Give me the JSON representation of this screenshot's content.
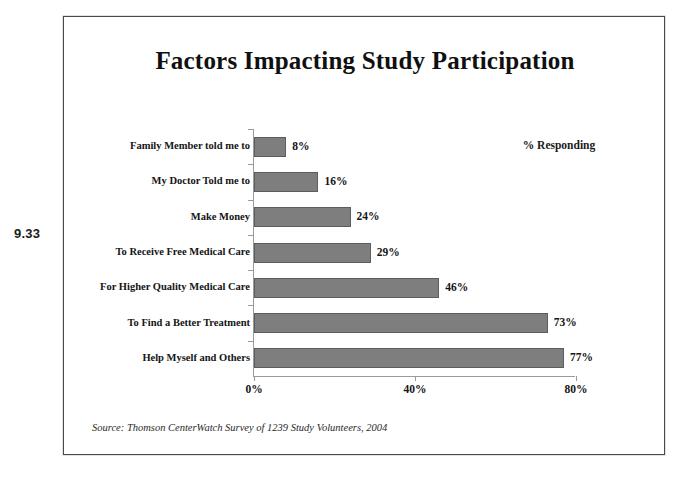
{
  "figure_number": "9.33",
  "legend_note": "% Responding",
  "source_note": "Source: Thomson CenterWatch Survey of 1239 Study Volunteers, 2004",
  "colors": {
    "bar_fill": "#7e7e7e",
    "bar_stroke": "#5d5d5d",
    "axis": "#9a9a9a",
    "text": "#141414",
    "frame": "#4a4a4a"
  },
  "chart_data": {
    "type": "bar",
    "orientation": "horizontal",
    "title": "Factors Impacting Study Participation",
    "xlabel": "",
    "ylabel": "",
    "xlim": [
      0,
      80
    ],
    "grid": false,
    "legend_position": "top-right",
    "legend_entries": [
      "% Responding"
    ],
    "xticks": [
      "0%",
      "40%",
      "80%"
    ],
    "xtick_values": [
      0,
      40,
      80
    ],
    "categories": [
      "Family Member told me to",
      "My Doctor Told me to",
      "Make Money",
      "To Receive Free Medical Care",
      "For Higher Quality Medical Care",
      "To Find a Better Treatment",
      "Help Myself and Others"
    ],
    "values": [
      8,
      16,
      24,
      29,
      46,
      73,
      77
    ],
    "value_labels": [
      "8%",
      "16%",
      "24%",
      "29%",
      "46%",
      "73%",
      "77%"
    ]
  }
}
